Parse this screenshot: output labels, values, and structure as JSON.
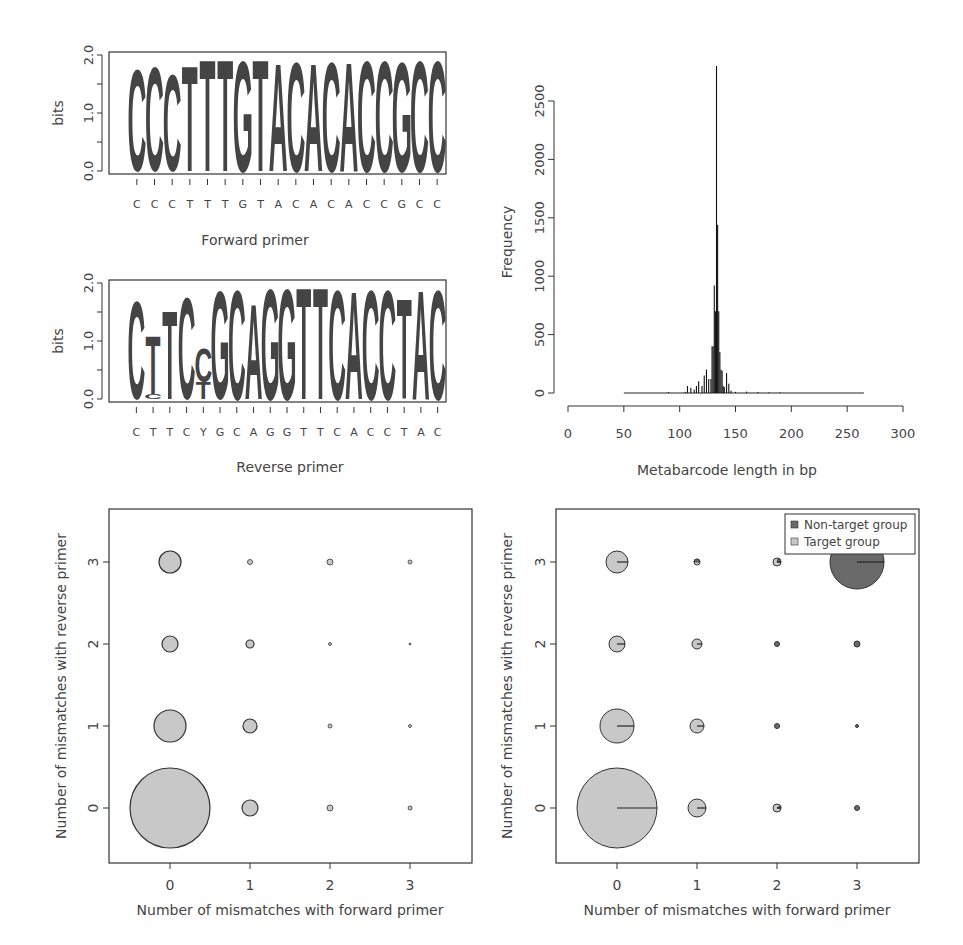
{
  "colors": {
    "C": "#3a3a3a",
    "T": "#6f6f6f",
    "G": "#b8b8b8",
    "A": "#c4c4c4",
    "target": "#c8c8c8",
    "nontarget": "#6a6a6a",
    "stroke": "#333333"
  },
  "chart_data": [
    {
      "type": "sequence-logo",
      "title": "Forward primer",
      "xlabel": "Forward primer",
      "ylabel": "bits",
      "ylim": [
        0,
        2.0
      ],
      "yticks": [
        "0.0",
        "1.0",
        "2.0"
      ],
      "sequence": [
        "C",
        "C",
        "C",
        "T",
        "T",
        "T",
        "G",
        "T",
        "A",
        "C",
        "A",
        "C",
        "A",
        "C",
        "C",
        "G",
        "C",
        "C"
      ],
      "heights": [
        1.82,
        1.86,
        1.72,
        1.88,
        1.99,
        1.99,
        1.97,
        1.99,
        1.94,
        1.96,
        1.94,
        1.96,
        1.95,
        1.97,
        1.97,
        1.95,
        1.97,
        1.97
      ]
    },
    {
      "type": "sequence-logo",
      "title": "Reverse primer",
      "xlabel": "Reverse primer",
      "ylabel": "bits",
      "ylim": [
        0,
        2.0
      ],
      "yticks": [
        "0.0",
        "1.0",
        "2.0"
      ],
      "sequence": [
        "C",
        "T",
        "T",
        "C",
        "Y",
        "G",
        "C",
        "A",
        "G",
        "G",
        "T",
        "T",
        "C",
        "A",
        "C",
        "C",
        "T",
        "A",
        "C"
      ],
      "stacks": [
        [
          {
            "l": "C",
            "h": 1.75
          }
        ],
        [
          {
            "l": "C",
            "h": 0.08
          },
          {
            "l": "T",
            "h": 1.05
          }
        ],
        [
          {
            "l": "T",
            "h": 1.58
          }
        ],
        [
          {
            "l": "C",
            "h": 1.82
          }
        ],
        [
          {
            "l": "T",
            "h": 0.3
          },
          {
            "l": "C",
            "h": 0.6
          }
        ],
        [
          {
            "l": "G",
            "h": 1.93
          }
        ],
        [
          {
            "l": "C",
            "h": 1.95
          }
        ],
        [
          {
            "l": "A",
            "h": 1.7
          }
        ],
        [
          {
            "l": "G",
            "h": 1.97
          }
        ],
        [
          {
            "l": "G",
            "h": 1.97
          }
        ],
        [
          {
            "l": "T",
            "h": 1.99
          }
        ],
        [
          {
            "l": "T",
            "h": 1.99
          }
        ],
        [
          {
            "l": "C",
            "h": 1.96
          }
        ],
        [
          {
            "l": "A",
            "h": 1.94
          }
        ],
        [
          {
            "l": "C",
            "h": 1.96
          }
        ],
        [
          {
            "l": "C",
            "h": 1.96
          }
        ],
        [
          {
            "l": "T",
            "h": 1.78
          }
        ],
        [
          {
            "l": "A",
            "h": 1.96
          }
        ],
        [
          {
            "l": "C",
            "h": 1.96
          }
        ]
      ]
    },
    {
      "type": "bar",
      "subtype": "histogram",
      "xlabel": "Metabarcode length in bp",
      "ylabel": "Frequency",
      "xlim": [
        0,
        300
      ],
      "ylim": [
        0,
        2800
      ],
      "xticks": [
        0,
        50,
        100,
        150,
        200,
        250,
        300
      ],
      "yticks": [
        0,
        500,
        1000,
        1500,
        2000,
        2500
      ],
      "range_observed": [
        50,
        265
      ],
      "x": [
        90,
        105,
        107,
        110,
        113,
        115,
        117,
        120,
        122,
        124,
        126,
        128,
        129,
        130,
        131,
        132,
        133,
        134,
        135,
        136,
        137,
        138,
        139,
        140,
        142,
        144,
        146,
        150,
        160,
        170,
        180,
        190
      ],
      "values": [
        8,
        10,
        60,
        45,
        30,
        60,
        100,
        60,
        150,
        200,
        120,
        120,
        400,
        400,
        920,
        700,
        2800,
        1440,
        700,
        350,
        200,
        190,
        60,
        50,
        170,
        80,
        20,
        10,
        12,
        8,
        6,
        6
      ]
    },
    {
      "type": "scatter",
      "subtype": "bubble",
      "xlabel": "Number of mismatches with forward primer",
      "ylabel": "Number of mismatches with reverse primer",
      "xticks": [
        0,
        1,
        2,
        3
      ],
      "yticks": [
        0,
        1,
        2,
        3
      ],
      "points": [
        {
          "x": 0,
          "y": 0,
          "r": 40
        },
        {
          "x": 1,
          "y": 0,
          "r": 8
        },
        {
          "x": 2,
          "y": 0,
          "r": 3
        },
        {
          "x": 3,
          "y": 0,
          "r": 2
        },
        {
          "x": 0,
          "y": 1,
          "r": 16
        },
        {
          "x": 1,
          "y": 1,
          "r": 7
        },
        {
          "x": 2,
          "y": 1,
          "r": 2
        },
        {
          "x": 3,
          "y": 1,
          "r": 1.5
        },
        {
          "x": 0,
          "y": 2,
          "r": 8
        },
        {
          "x": 1,
          "y": 2,
          "r": 4
        },
        {
          "x": 2,
          "y": 2,
          "r": 1.5
        },
        {
          "x": 3,
          "y": 2,
          "r": 1
        },
        {
          "x": 0,
          "y": 3,
          "r": 11
        },
        {
          "x": 1,
          "y": 3,
          "r": 2.5
        },
        {
          "x": 2,
          "y": 3,
          "r": 3
        },
        {
          "x": 3,
          "y": 3,
          "r": 2
        }
      ]
    },
    {
      "type": "pie-scatter",
      "xlabel": "Number of mismatches with forward primer",
      "ylabel": "Number of mismatches with reverse primer",
      "xticks": [
        0,
        1,
        2,
        3
      ],
      "yticks": [
        0,
        1,
        2,
        3
      ],
      "legend": [
        {
          "label": "Non-target group",
          "color": "#6a6a6a"
        },
        {
          "label": "Target group",
          "color": "#c8c8c8"
        }
      ],
      "legend_position": "top-right",
      "points": [
        {
          "x": 0,
          "y": 0,
          "r": 40,
          "nontarget_frac": 0.0
        },
        {
          "x": 1,
          "y": 0,
          "r": 9,
          "nontarget_frac": 0.0
        },
        {
          "x": 2,
          "y": 0,
          "r": 4,
          "nontarget_frac": 0.1
        },
        {
          "x": 3,
          "y": 0,
          "r": 2.5,
          "nontarget_frac": 1.0
        },
        {
          "x": 0,
          "y": 1,
          "r": 17,
          "nontarget_frac": 0.0
        },
        {
          "x": 1,
          "y": 1,
          "r": 7,
          "nontarget_frac": 0.0
        },
        {
          "x": 2,
          "y": 1,
          "r": 2.5,
          "nontarget_frac": 1.0
        },
        {
          "x": 3,
          "y": 1,
          "r": 1.5,
          "nontarget_frac": 1.0
        },
        {
          "x": 0,
          "y": 2,
          "r": 8,
          "nontarget_frac": 0.0
        },
        {
          "x": 1,
          "y": 2,
          "r": 5,
          "nontarget_frac": 0.0
        },
        {
          "x": 2,
          "y": 2,
          "r": 2.5,
          "nontarget_frac": 1.0
        },
        {
          "x": 3,
          "y": 2,
          "r": 3,
          "nontarget_frac": 1.0
        },
        {
          "x": 0,
          "y": 3,
          "r": 11,
          "nontarget_frac": 0.0
        },
        {
          "x": 1,
          "y": 3,
          "r": 3,
          "nontarget_frac": 0.5
        },
        {
          "x": 2,
          "y": 3,
          "r": 4,
          "nontarget_frac": 0.2
        },
        {
          "x": 3,
          "y": 3,
          "r": 27,
          "nontarget_frac": 1.0
        }
      ]
    }
  ]
}
